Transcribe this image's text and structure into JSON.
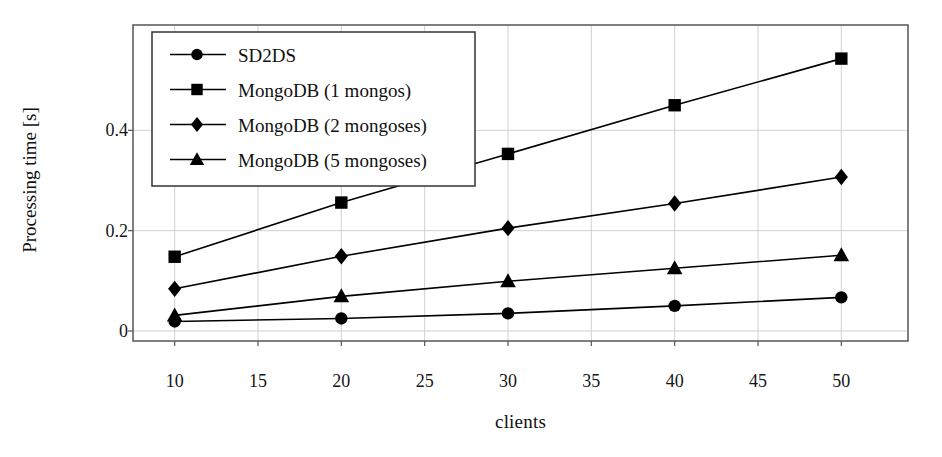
{
  "chart_data": {
    "type": "line",
    "title": "",
    "xlabel": "clients",
    "ylabel": "Processing time [s]",
    "x": [
      10,
      20,
      30,
      40,
      50
    ],
    "xlim": [
      7.5,
      54
    ],
    "ylim": [
      -0.02,
      0.61
    ],
    "xticks": [
      10,
      15,
      20,
      25,
      30,
      35,
      40,
      45,
      50
    ],
    "xticklabels": [
      "10",
      "15",
      "20",
      "25",
      "30",
      "35",
      "40",
      "45",
      "50"
    ],
    "yticks": [
      0,
      0.2,
      0.4
    ],
    "yticklabels": [
      "0",
      "0.2",
      "0.4"
    ],
    "grid": true,
    "legend_position": "upper-left-inside",
    "series": [
      {
        "name": "SD2DS",
        "marker": "circle",
        "color": "#000000",
        "values": [
          0.019,
          0.025,
          0.035,
          0.05,
          0.067
        ]
      },
      {
        "name": "MongoDB (1 mongos)",
        "marker": "square",
        "color": "#000000",
        "values": [
          0.148,
          0.256,
          0.353,
          0.45,
          0.543
        ]
      },
      {
        "name": "MongoDB (2 mongoses)",
        "marker": "diamond",
        "color": "#000000",
        "values": [
          0.084,
          0.149,
          0.205,
          0.254,
          0.307
        ]
      },
      {
        "name": "MongoDB (5 mongoses)",
        "marker": "triangle",
        "color": "#000000",
        "values": [
          0.031,
          0.069,
          0.099,
          0.125,
          0.151
        ]
      }
    ]
  },
  "figure": {
    "background": "#ffffff",
    "axis_color": "#555555",
    "grid_color": "#cccccc",
    "line_color": "#000000"
  }
}
